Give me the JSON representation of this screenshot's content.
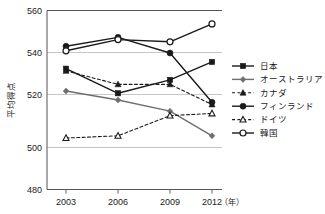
{
  "chart_data": {
    "type": "line",
    "title": "",
    "subtitle": "",
    "xlabel": "年",
    "ylabel": "平均得点",
    "x": [
      "2003",
      "2006",
      "2009",
      "2012"
    ],
    "categories": [
      "2003",
      "2006",
      "2009",
      "2012"
    ],
    "xlim": [
      2003,
      2012
    ],
    "ylim": [
      480,
      560
    ],
    "yticks": [
      "480",
      "500",
      "520",
      "540",
      "560"
    ],
    "ytick_values": [
      480,
      500,
      520,
      540,
      560
    ],
    "grid": "horizontal",
    "legend_position": "right",
    "series": [
      {
        "name": "日本",
        "values": [
          534,
          523,
          529,
          537
        ],
        "marker": "filled-square",
        "linestyle": "solid",
        "color": "#1a1a1a"
      },
      {
        "name": "オーストラリア",
        "values": [
          524,
          520,
          515,
          504
        ],
        "marker": "filled-diamond",
        "linestyle": "solid",
        "color": "#6e6e6e"
      },
      {
        "name": "カナダ",
        "values": [
          533,
          527,
          527,
          518
        ],
        "marker": "filled-triangle",
        "linestyle": "dashed",
        "color": "#1a1a1a"
      },
      {
        "name": "フィンランド",
        "values": [
          544,
          548,
          541,
          519
        ],
        "marker": "filled-circle",
        "linestyle": "solid",
        "color": "#1a1a1a"
      },
      {
        "name": "ドイツ",
        "values": [
          503,
          504,
          513,
          514
        ],
        "marker": "open-triangle",
        "linestyle": "dashed",
        "color": "#1a1a1a"
      },
      {
        "name": "韓国",
        "values": [
          542,
          547,
          546,
          554
        ],
        "marker": "open-circle",
        "linestyle": "solid",
        "color": "#1a1a1a"
      }
    ]
  },
  "axes": {
    "y_axis_title": "平均得点",
    "x_axis_unit": "（年）",
    "y_ticks": [
      "560",
      "540",
      "520",
      "500",
      "480"
    ],
    "x_ticks": [
      "2003",
      "2006",
      "2009",
      "2012"
    ]
  },
  "legend": {
    "items": [
      {
        "label": "日本"
      },
      {
        "label": "オーストラリア"
      },
      {
        "label": "カナダ"
      },
      {
        "label": "フィンランド"
      },
      {
        "label": "ドイツ"
      },
      {
        "label": "韓国"
      }
    ]
  }
}
